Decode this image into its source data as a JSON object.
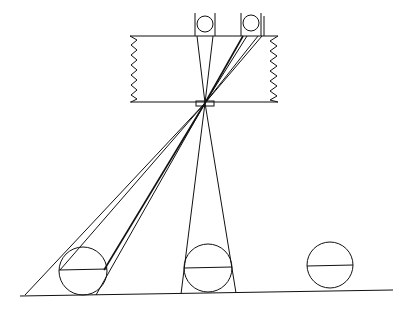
{
  "diagram": {
    "description": "Pinhole camera obscura diagram: three spheres on a ground plane, rays converge through an aperture in a box and project inverted images onto the back wall",
    "colors": {
      "stroke": "#111111",
      "background": "#ffffff"
    },
    "box": {
      "x": 130,
      "y": 36,
      "width": 148,
      "height": 66
    },
    "aperture": {
      "x": 196,
      "y": 101,
      "width": 18,
      "height": 5,
      "focal_point": [
        205,
        103
      ]
    },
    "projected_images": [
      {
        "cx": 205,
        "cy": 23,
        "r": 8
      },
      {
        "cx": 251,
        "cy": 23,
        "r": 8
      }
    ],
    "objects": [
      {
        "cx": 83,
        "cy": 270,
        "r": 23
      },
      {
        "cx": 208,
        "cy": 268,
        "r": 23
      },
      {
        "cx": 330,
        "cy": 265,
        "r": 23
      }
    ],
    "ground": {
      "x1": 20,
      "y1": 296,
      "x2": 393,
      "y2": 290
    }
  }
}
